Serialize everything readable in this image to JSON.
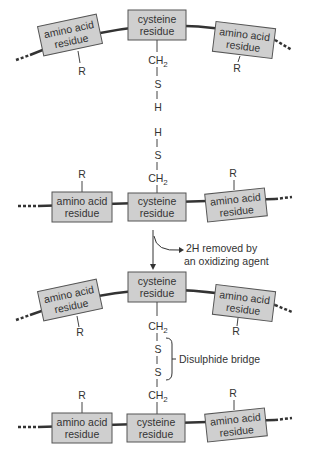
{
  "diagram": {
    "labels": {
      "amino_acid_1": "amino acid",
      "amino_acid_2": "residue",
      "cysteine_1": "cysteine",
      "cysteine_2": "residue",
      "r_group": "R",
      "ch2_c": "CH",
      "ch2_sub": "2",
      "sulfur": "S",
      "hydrogen": "H"
    },
    "reaction": {
      "line1": "2H removed by",
      "line2": "an oxidizing agent"
    },
    "bridge_label": "Disulphide bridge",
    "colors": {
      "box_fill": "#cfcfcf",
      "line": "#333333"
    }
  }
}
